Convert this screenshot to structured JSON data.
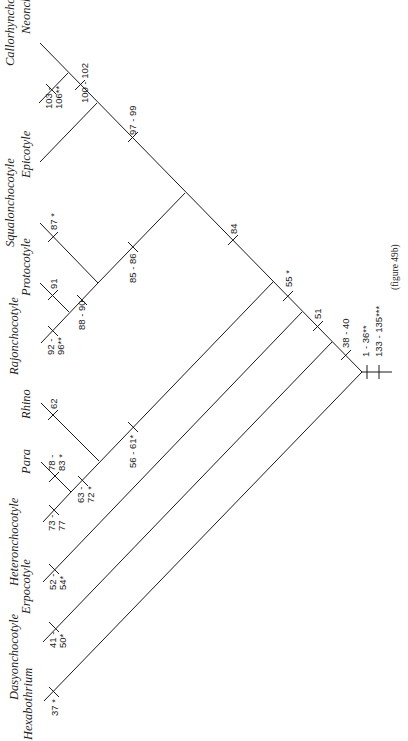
{
  "figure": {
    "caption": "(figure 49b)",
    "type": "cladogram"
  },
  "taxa": [
    {
      "id": "neonchocotyle",
      "label": "Neonchocotyle",
      "tip": [
        40,
        43
      ],
      "label_pos": [
        30,
        34
      ]
    },
    {
      "id": "callorhynchocotyle",
      "label": "Callorhynchocotyle",
      "tip": [
        39,
        103
      ],
      "label_pos": [
        14,
        66
      ]
    },
    {
      "id": "epicotyle",
      "label": "Epicotyle",
      "tip": [
        40,
        162
      ],
      "label_pos": [
        30,
        178
      ]
    },
    {
      "id": "squalonchocotyle",
      "label": "Squalonchocotyle",
      "tip": [
        40,
        223
      ],
      "label_pos": [
        14,
        247
      ]
    },
    {
      "id": "protocotyle",
      "label": "Protocotyle",
      "tip": [
        40,
        283
      ],
      "label_pos": [
        30,
        296
      ]
    },
    {
      "id": "rajonchocotyle",
      "label": "Rajonchocotyle",
      "tip": [
        41,
        343
      ],
      "label_pos": [
        18,
        375
      ]
    },
    {
      "id": "rhino",
      "label": "Rhino",
      "tip": [
        41,
        403
      ],
      "label_pos": [
        30,
        419
      ]
    },
    {
      "id": "para",
      "label": "Para",
      "tip": [
        41,
        462
      ],
      "label_pos": [
        30,
        474
      ]
    },
    {
      "id": "heteronchocotyle",
      "label": "Heteronchocotyle",
      "tip": [
        43,
        522
      ],
      "label_pos": [
        18,
        586
      ]
    },
    {
      "id": "erpocotyle",
      "label": "Erpocotyle",
      "tip": [
        43,
        582
      ],
      "label_pos": [
        30,
        614
      ]
    },
    {
      "id": "dasyonchocotyle",
      "label": "Dasyonchocotyle",
      "tip": [
        43,
        642
      ],
      "label_pos": [
        18,
        700
      ]
    },
    {
      "id": "hexabothrium",
      "label": "Hexabothrium",
      "tip": [
        44,
        701
      ],
      "label_pos": [
        32,
        740
      ]
    }
  ],
  "branches": [
    {
      "id": "spine",
      "from": [
        40,
        43
      ],
      "to": [
        362,
        372
      ]
    },
    {
      "id": "callorhynchocotyle-branch",
      "from": [
        39,
        103
      ],
      "to": [
        68,
        73
      ]
    },
    {
      "id": "epicotyle-branch",
      "from": [
        40,
        162
      ],
      "to": [
        97,
        103
      ]
    },
    {
      "id": "squalo-clade-stem",
      "from": [
        98,
        283
      ],
      "to": [
        185,
        193
      ]
    },
    {
      "id": "squalonchocotyle-branch",
      "from": [
        40,
        223
      ],
      "to": [
        98,
        283
      ]
    },
    {
      "id": "rajon-proto-stem",
      "from": [
        41,
        343
      ],
      "to": [
        98,
        283
      ]
    },
    {
      "id": "protocotyle-branch",
      "from": [
        40,
        283
      ],
      "to": [
        69,
        312
      ]
    },
    {
      "id": "rhino-clade-stem",
      "from": [
        71,
        492
      ],
      "to": [
        273,
        282
      ]
    },
    {
      "id": "heteronchocotyle-branch",
      "from": [
        43,
        522
      ],
      "to": [
        71,
        492
      ]
    },
    {
      "id": "para-branch",
      "from": [
        41,
        462
      ],
      "to": [
        71,
        492
      ]
    },
    {
      "id": "rhino-branch",
      "from": [
        41,
        403
      ],
      "to": [
        99,
        461
      ]
    },
    {
      "id": "erpocotyle-branch",
      "from": [
        43,
        582
      ],
      "to": [
        302,
        312
      ]
    },
    {
      "id": "dasyonchocotyle-branch",
      "from": [
        43,
        642
      ],
      "to": [
        332,
        342
      ]
    },
    {
      "id": "hexabothrium-branch",
      "from": [
        44,
        701
      ],
      "to": [
        362,
        372
      ]
    },
    {
      "id": "root-stem",
      "from": [
        362,
        372
      ],
      "to": [
        392,
        372
      ]
    }
  ],
  "characters": [
    {
      "id": "c100-102",
      "label": "100 - 102",
      "tick": [
        80,
        85
      ],
      "orient": "spine",
      "text_pos": [
        88,
        103
      ]
    },
    {
      "id": "c103-106",
      "label": "103 -",
      "label2": "106**",
      "tick": [
        51,
        89
      ],
      "orient": "up",
      "text_pos": [
        52,
        109
      ],
      "text_pos2": [
        62,
        109
      ]
    },
    {
      "id": "c97-99",
      "label": "97 - 99",
      "tick": [
        133,
        137
      ],
      "orient": "spine",
      "text_pos": [
        136,
        135
      ]
    },
    {
      "id": "c87",
      "label": "87 *",
      "tick": [
        53,
        237
      ],
      "orient": "spine",
      "text_pos": [
        57,
        230
      ]
    },
    {
      "id": "c91",
      "label": "91",
      "tick": [
        53,
        295
      ],
      "orient": "spine",
      "text_pos": [
        57,
        289
      ]
    },
    {
      "id": "c92-96",
      "label": "92 -",
      "label2": "96**",
      "tick": [
        53,
        331
      ],
      "orient": "up",
      "text_pos": [
        54,
        355
      ],
      "text_pos2": [
        64,
        355
      ]
    },
    {
      "id": "c88-90",
      "label": "88 - 90",
      "tick": [
        82,
        300
      ],
      "orient": "up",
      "text_pos": [
        85,
        330
      ]
    },
    {
      "id": "c85-86",
      "label": "85 - 86",
      "tick": [
        133,
        247
      ],
      "orient": "up",
      "text_pos": [
        136,
        283
      ]
    },
    {
      "id": "c84",
      "label": "84",
      "tick": [
        233,
        240
      ],
      "orient": "spine",
      "text_pos": [
        237,
        234
      ]
    },
    {
      "id": "c55",
      "label": "55 *",
      "tick": [
        288,
        296
      ],
      "orient": "spine",
      "text_pos": [
        292,
        287
      ]
    },
    {
      "id": "c51",
      "label": "51",
      "tick": [
        318,
        326
      ],
      "orient": "spine",
      "text_pos": [
        321,
        319
      ]
    },
    {
      "id": "c38-40",
      "label": "38 - 40",
      "tick": [
        346,
        355
      ],
      "orient": "spine",
      "text_pos": [
        349,
        348
      ]
    },
    {
      "id": "c62",
      "label": "62",
      "tick": [
        53,
        415
      ],
      "orient": "spine",
      "text_pos": [
        57,
        409
      ]
    },
    {
      "id": "c78-83",
      "label": "78 -",
      "label2": "83 *",
      "tick": [
        54,
        477
      ],
      "orient": "spine",
      "text_pos": [
        55,
        471
      ],
      "text_pos2": [
        65,
        471
      ]
    },
    {
      "id": "c63-72",
      "label": "63 -",
      "label2": "72 *",
      "tick": [
        83,
        481
      ],
      "orient": "up",
      "text_pos": [
        84,
        503
      ],
      "text_pos2": [
        94,
        503
      ]
    },
    {
      "id": "c73-77",
      "label": "73 -",
      "label2": "77",
      "tick": [
        54,
        510
      ],
      "orient": "up",
      "text_pos": [
        55,
        531
      ],
      "text_pos2": [
        65,
        531
      ]
    },
    {
      "id": "c56-61",
      "label": "56 - 61*",
      "tick": [
        133,
        427
      ],
      "orient": "up",
      "text_pos": [
        136,
        468
      ]
    },
    {
      "id": "c52-54",
      "label": "52 -",
      "label2": "54*",
      "tick": [
        54,
        569
      ],
      "orient": "up",
      "text_pos": [
        56,
        590
      ],
      "text_pos2": [
        66,
        590
      ]
    },
    {
      "id": "c41-50",
      "label": "41 -",
      "label2": "50*",
      "tick": [
        54,
        627
      ],
      "orient": "up",
      "text_pos": [
        56,
        648
      ],
      "text_pos2": [
        66,
        648
      ]
    },
    {
      "id": "c37",
      "label": "37 *",
      "tick": [
        54,
        692
      ],
      "orient": "up",
      "text_pos": [
        58,
        716
      ]
    },
    {
      "id": "c1-36",
      "label": "1 - 36**",
      "tick": [
        367,
        372
      ],
      "orient": "vertical",
      "text_pos": [
        369,
        357
      ]
    },
    {
      "id": "c133-135",
      "label": "133 - 135***",
      "tick": [
        379,
        372
      ],
      "orient": "vertical",
      "text_pos": [
        382,
        357
      ]
    }
  ],
  "caption_pos": [
    398,
    290
  ]
}
